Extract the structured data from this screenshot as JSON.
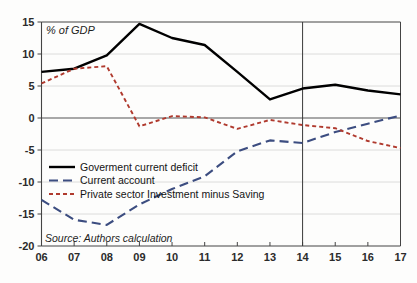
{
  "chart_data": {
    "type": "line",
    "title": "",
    "subtitle": "",
    "axis_note": "% of GDP",
    "source_note": "Source: Authors calculation",
    "xlabel": "",
    "ylabel": "",
    "grid": true,
    "legend_position": "center-left",
    "xlim": [
      2006,
      2017
    ],
    "ylim": [
      -20,
      15
    ],
    "yticks": [
      15,
      10,
      5,
      0,
      -5,
      -10,
      -15,
      -20
    ],
    "ytick_labels": [
      "15",
      "10",
      "5",
      "0",
      "-5",
      "-10",
      "-15",
      "-20"
    ],
    "x": [
      2006,
      2007,
      2008,
      2009,
      2010,
      2011,
      2012,
      2013,
      2014,
      2015,
      2016,
      2017
    ],
    "xtick_labels": [
      "06",
      "07",
      "08",
      "09",
      "10",
      "11",
      "12",
      "13",
      "14",
      "15",
      "16",
      "17"
    ],
    "forecast_divider_x": 2014,
    "series": [
      {
        "name": "Goverment current deficit",
        "color": "#000000",
        "style": "solid",
        "values": [
          7.2,
          7.7,
          9.8,
          14.7,
          12.5,
          11.4,
          7.2,
          2.9,
          4.6,
          5.2,
          4.3,
          3.7
        ]
      },
      {
        "name": "Current account",
        "color": "#3c4d80",
        "style": "dashed",
        "values": [
          -12.8,
          -15.9,
          -16.7,
          -13.5,
          -11.1,
          -9.1,
          -5.2,
          -3.5,
          -3.9,
          -2.2,
          -0.9,
          0.4
        ]
      },
      {
        "name": "Private sector Investment minus Saving",
        "color": "#b03a2e",
        "style": "dotted",
        "values": [
          5.4,
          7.7,
          8.1,
          -1.3,
          0.3,
          0.1,
          -1.7,
          -0.3,
          -1.1,
          -1.6,
          -3.6,
          -4.7
        ]
      }
    ]
  },
  "legend": {
    "items": [
      {
        "label": "Goverment current deficit",
        "color": "#000000",
        "style": "solid"
      },
      {
        "label": "Current account",
        "color": "#3c4d80",
        "style": "dashed"
      },
      {
        "label": "Private sector Investment minus Saving",
        "color": "#b03a2e",
        "style": "dotted"
      }
    ]
  }
}
